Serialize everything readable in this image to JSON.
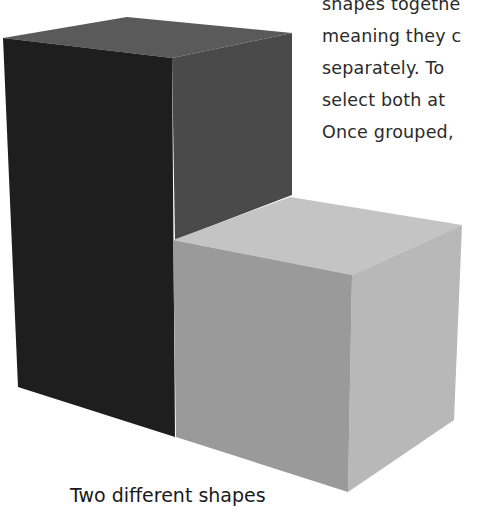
{
  "text_block": {
    "lines": [
      "shapes togethe",
      "meaning they c",
      "separately. To",
      "select both at",
      "Once grouped,"
    ]
  },
  "figure": {
    "caption": "Two different shapes",
    "shapes": [
      {
        "name": "tall-box",
        "colors": {
          "front": "#1e1e1e",
          "side": "#4a4a4a",
          "top": "#5a5a5a"
        }
      },
      {
        "name": "short-box",
        "colors": {
          "front": "#9a9a9a",
          "side": "#b8b8b8",
          "top": "#c4c4c4"
        }
      }
    ]
  }
}
